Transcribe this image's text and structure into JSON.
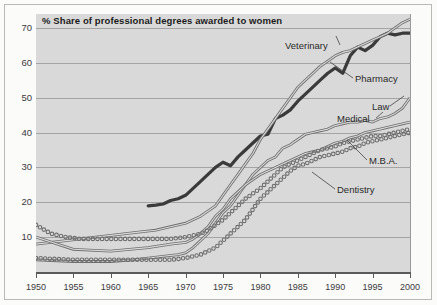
{
  "chart_data": {
    "type": "line",
    "title": "% Share of professional degrees awarded to women",
    "xlabel": "",
    "ylabel": "",
    "xlim": [
      1950,
      2000
    ],
    "ylim": [
      0,
      74
    ],
    "grid": true,
    "legend_position": "inline-annotations",
    "yticks": [
      10,
      20,
      30,
      40,
      50,
      60,
      70
    ],
    "xticks": [
      1950,
      1955,
      1960,
      1965,
      1970,
      1975,
      1980,
      1985,
      1990,
      1995,
      2000
    ],
    "series": [
      {
        "name": "Veterinary",
        "style": "thick-solid-dark",
        "color": "#3a3a3a",
        "x": [
          1965,
          1966,
          1967,
          1968,
          1969,
          1970,
          1971,
          1972,
          1973,
          1974,
          1975,
          1976,
          1977,
          1978,
          1979,
          1980,
          1981,
          1982,
          1983,
          1984,
          1985,
          1986,
          1987,
          1988,
          1989,
          1990,
          1991,
          1992,
          1993,
          1994,
          1995,
          1996,
          1997,
          1998,
          1999,
          2000
        ],
        "values": [
          19,
          19.2,
          19.5,
          20.5,
          21,
          22,
          24,
          26,
          28,
          30,
          31.5,
          30.5,
          33,
          35,
          37,
          39,
          39.5,
          44,
          45,
          46.5,
          49,
          51,
          53,
          55,
          57,
          58.5,
          57,
          62,
          64.5,
          63.5,
          65,
          67.5,
          68.5,
          68,
          68.5,
          68.5
        ]
      },
      {
        "name": "Pharmacy",
        "style": "double-thin-solid",
        "color": "#6e6e6e",
        "x": [
          1950,
          1952,
          1954,
          1956,
          1958,
          1960,
          1962,
          1964,
          1966,
          1968,
          1970,
          1972,
          1974,
          1975,
          1976,
          1977,
          1978,
          1979,
          1980,
          1981,
          1982,
          1983,
          1984,
          1985,
          1986,
          1987,
          1988,
          1989,
          1990,
          1991,
          1992,
          1993,
          1994,
          1995,
          1996,
          1997,
          1998,
          1999,
          2000
        ],
        "values": [
          8,
          8.5,
          9,
          9.5,
          10,
          10.5,
          11,
          11.5,
          12,
          13,
          14,
          16,
          19,
          22,
          25,
          28,
          31,
          34,
          38,
          41,
          44,
          47,
          50,
          53,
          55,
          57,
          59,
          60.5,
          62,
          63,
          63.5,
          64.5,
          65.5,
          66.5,
          67.5,
          68.5,
          70,
          71.5,
          72.5
        ]
      },
      {
        "name": "Law",
        "style": "double-thin-solid",
        "color": "#6e6e6e",
        "x": [
          1950,
          1955,
          1960,
          1963,
          1965,
          1967,
          1969,
          1970,
          1971,
          1972,
          1973,
          1974,
          1975,
          1976,
          1977,
          1978,
          1979,
          1980,
          1981,
          1982,
          1983,
          1984,
          1985,
          1986,
          1987,
          1988,
          1989,
          1990,
          1991,
          1992,
          1993,
          1994,
          1995,
          1996,
          1997,
          1998,
          1999,
          2000
        ],
        "values": [
          3.5,
          3,
          3,
          3.5,
          4,
          4.5,
          5,
          5.5,
          7,
          9,
          11,
          14,
          17,
          19,
          22,
          25,
          28,
          30,
          32,
          33,
          35.5,
          36.5,
          38,
          39.5,
          40,
          40.5,
          41,
          42,
          42.5,
          43,
          43,
          43.5,
          43,
          44,
          44.5,
          45.5,
          47,
          50
        ]
      },
      {
        "name": "Medical",
        "style": "double-thin-solid",
        "color": "#6e6e6e",
        "x": [
          1950,
          1955,
          1960,
          1965,
          1968,
          1970,
          1971,
          1972,
          1973,
          1974,
          1975,
          1976,
          1977,
          1978,
          1979,
          1980,
          1981,
          1982,
          1983,
          1984,
          1985,
          1986,
          1987,
          1988,
          1989,
          1990,
          1991,
          1992,
          1993,
          1994,
          1995,
          1996,
          1997,
          1998,
          1999,
          2000
        ],
        "values": [
          10,
          6.5,
          6,
          7,
          8,
          8.5,
          9.5,
          11,
          13,
          16,
          18,
          21,
          23,
          25,
          26.5,
          28,
          29,
          30,
          31,
          32,
          33,
          34,
          34.5,
          35,
          36,
          37,
          37.5,
          38.5,
          39,
          40,
          40.5,
          41,
          41.5,
          42,
          42.5,
          43
        ]
      },
      {
        "name": "M.B.A.",
        "style": "dotted-circles",
        "color": "#6e6e6e",
        "x": [
          1950,
          1955,
          1960,
          1965,
          1968,
          1970,
          1971,
          1972,
          1973,
          1974,
          1975,
          1976,
          1977,
          1978,
          1979,
          1980,
          1981,
          1982,
          1983,
          1984,
          1985,
          1986,
          1987,
          1988,
          1989,
          1990,
          1991,
          1992,
          1993,
          1994,
          1995,
          1996,
          1997,
          1998,
          1999,
          2000
        ],
        "values": [
          4,
          3.5,
          3.5,
          3.5,
          3.5,
          4,
          4.5,
          5,
          6,
          7,
          9,
          11,
          13,
          15,
          18,
          21,
          23,
          25,
          27,
          29,
          30.5,
          31,
          32,
          33,
          33.5,
          34,
          34.5,
          35.5,
          36,
          37,
          37.5,
          38,
          38.5,
          39,
          39.5,
          40
        ]
      },
      {
        "name": "Dentistry",
        "style": "dotted-circles",
        "color": "#6e6e6e",
        "x": [
          1950,
          1952,
          1954,
          1956,
          1958,
          1960,
          1962,
          1964,
          1966,
          1968,
          1970,
          1971,
          1972,
          1973,
          1974,
          1975,
          1976,
          1977,
          1978,
          1979,
          1980,
          1981,
          1982,
          1983,
          1984,
          1985,
          1986,
          1987,
          1988,
          1989,
          1990,
          1991,
          1992,
          1993,
          1994,
          1995,
          1996,
          1997,
          1998,
          1999,
          2000
        ],
        "values": [
          13.5,
          11,
          10,
          9.5,
          9.5,
          9.5,
          9.5,
          9.5,
          9.5,
          9.5,
          10,
          10.5,
          11,
          12,
          13.5,
          15,
          17,
          19,
          21,
          22.5,
          24,
          26,
          28,
          30,
          31,
          32,
          33,
          34,
          35,
          35.5,
          36,
          37,
          37.5,
          38,
          38.5,
          39,
          39,
          39.5,
          40,
          40.5,
          41
        ]
      }
    ],
    "annotations": [
      {
        "label": "Veterinary",
        "x": 285,
        "y": 40
      },
      {
        "label": "Pharmacy",
        "x": 355,
        "y": 73
      },
      {
        "label": "Law",
        "x": 372,
        "y": 101
      },
      {
        "label": "Medical",
        "x": 337,
        "y": 113
      },
      {
        "label": "M.B.A.",
        "x": 369,
        "y": 155
      },
      {
        "label": "Dentistry",
        "x": 337,
        "y": 184
      }
    ]
  }
}
